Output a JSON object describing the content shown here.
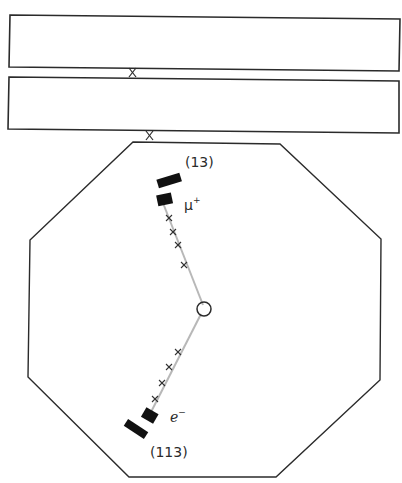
{
  "diagram": {
    "title": "",
    "colors": {
      "outline": "#2b2b2b",
      "track": "#b8b8b8",
      "calorimeter_block": "#111111",
      "hit_mark": "#333333"
    },
    "labels": {
      "upper_block_id": "(13)",
      "upper_particle": "μ",
      "upper_particle_charge": "+",
      "lower_particle": "e",
      "lower_particle_charge": "−",
      "lower_block_id": "(113)"
    },
    "beams": [
      {
        "name": "upper-chamber"
      },
      {
        "name": "lower-chamber"
      }
    ],
    "tracks": [
      {
        "particle": "μ+",
        "hits": 4
      },
      {
        "particle": "e−",
        "hits": 4
      }
    ]
  }
}
